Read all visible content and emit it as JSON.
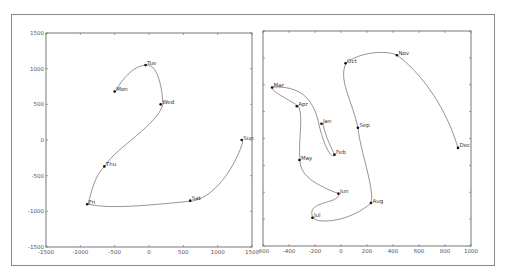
{
  "chart_data": [
    {
      "type": "line",
      "title": "",
      "xlabel": "",
      "ylabel": "",
      "xlim": [
        -1500,
        1500
      ],
      "ylim": [
        -1500,
        1500
      ],
      "xticks": [
        -1500,
        -1000,
        -500,
        0,
        500,
        1000,
        1500
      ],
      "yticks": [
        -1500,
        -1000,
        -500,
        0,
        500,
        1000,
        1500
      ],
      "grid": false,
      "smooth_curve": true,
      "points": [
        {
          "label": "Mon",
          "x": -500,
          "y": 680
        },
        {
          "label": "Tue",
          "x": -50,
          "y": 1050
        },
        {
          "label": "Wed",
          "x": 170,
          "y": 500
        },
        {
          "label": "Thu",
          "x": -650,
          "y": -370
        },
        {
          "label": "Fri",
          "x": -900,
          "y": -900
        },
        {
          "label": "Sat",
          "x": 600,
          "y": -850
        },
        {
          "label": "Sun",
          "x": 1350,
          "y": 0
        }
      ]
    },
    {
      "type": "line",
      "title": "",
      "xlabel": "",
      "ylabel": "",
      "xlim": [
        -600,
        1000
      ],
      "xticks": [
        -600,
        -400,
        -200,
        0,
        200,
        400,
        600,
        800,
        1000
      ],
      "yticks_labeled": false,
      "grid": false,
      "smooth_curve": true,
      "points": [
        {
          "label": "Jan",
          "x": -150,
          "y": 110
        },
        {
          "label": "Feb",
          "x": -50,
          "y": -120
        },
        {
          "label": "Mar",
          "x": -530,
          "y": 380
        },
        {
          "label": "Apr",
          "x": -340,
          "y": 240
        },
        {
          "label": "May",
          "x": -320,
          "y": -160
        },
        {
          "label": "Jun",
          "x": -20,
          "y": -410
        },
        {
          "label": "Jul",
          "x": -220,
          "y": -590
        },
        {
          "label": "Aug",
          "x": 230,
          "y": -480
        },
        {
          "label": "Sep",
          "x": 130,
          "y": 80
        },
        {
          "label": "Oct",
          "x": 35,
          "y": 560
        },
        {
          "label": "Nov",
          "x": 430,
          "y": 620
        },
        {
          "label": "Dec",
          "x": 900,
          "y": -70
        }
      ]
    }
  ],
  "left": {
    "xtick_labels": [
      "-1500",
      "-1000",
      "-500",
      "0",
      "500",
      "1000",
      "1500"
    ],
    "ytick_labels": [
      "1500",
      "1000",
      "500",
      "0",
      "-500",
      "-1000",
      "-1500"
    ],
    "labels": [
      "Mon",
      "Tue",
      "Wed",
      "Thu",
      "Fri",
      "Sat",
      "Sun"
    ]
  },
  "right": {
    "xtick_labels": [
      "-600",
      "-400",
      "-200",
      "0",
      "200",
      "400",
      "600",
      "800",
      "1000"
    ],
    "labels": [
      "Jan",
      "Feb",
      "Mar",
      "Apr",
      "May",
      "Jun",
      "Jul",
      "Aug",
      "Sep",
      "Oct",
      "Nov",
      "Dec"
    ]
  }
}
